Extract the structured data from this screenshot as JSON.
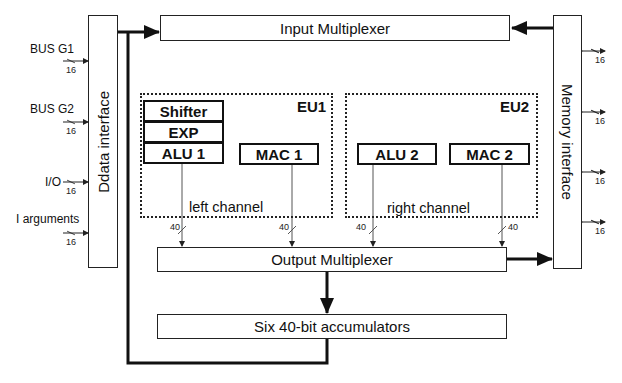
{
  "diagram": {
    "blocks": {
      "data_interface": "Ddata interface",
      "input_mux": "Input Multiplexer",
      "memory_interface": "Memory interface",
      "output_mux": "Output Multiplexer",
      "accumulators": "Six 40-bit accumulators"
    },
    "eu1": {
      "label": "EU1",
      "channel": "left channel",
      "units": [
        "Shifter",
        "EXP",
        "ALU 1",
        "MAC 1"
      ]
    },
    "eu2": {
      "label": "EU2",
      "channel": "right channel",
      "units": [
        "ALU 2",
        "MAC 2"
      ]
    },
    "left_inputs": [
      {
        "label": "BUS G1",
        "width": "16"
      },
      {
        "label": "BUS G2",
        "width": "16"
      },
      {
        "label": "I/O",
        "width": "16"
      },
      {
        "label": "I arguments",
        "width": "16"
      }
    ],
    "memory_ports": [
      {
        "width": "16"
      },
      {
        "width": "16"
      },
      {
        "width": "16"
      },
      {
        "width": "16"
      }
    ],
    "channel_widths": [
      "40",
      "40",
      "40",
      "40"
    ],
    "colors": {
      "line": "#111111",
      "background": "#ffffff"
    }
  }
}
